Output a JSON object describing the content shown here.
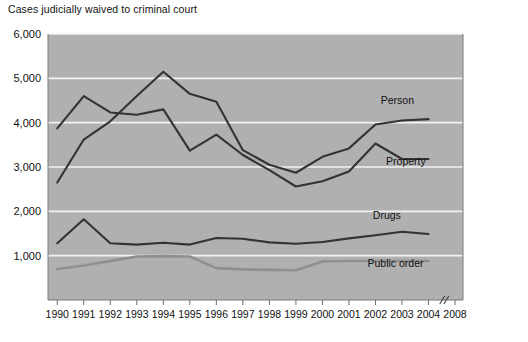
{
  "chart_data": {
    "type": "line",
    "title": "Cases judicially waived to criminal court",
    "xlabel": "",
    "ylabel": "",
    "ylim": [
      0,
      6000
    ],
    "xlim": [
      1990,
      2004
    ],
    "grid": true,
    "legend_position": "inline-right",
    "axis_break": {
      "label": "//",
      "between": [
        "2004",
        "2008"
      ]
    },
    "y_ticks": [
      "1,000",
      "2,000",
      "3,000",
      "4,000",
      "5,000",
      "6,000"
    ],
    "y_tick_values": [
      1000,
      2000,
      3000,
      4000,
      5000,
      6000
    ],
    "categories": [
      "1990",
      "1991",
      "1992",
      "1993",
      "1994",
      "1995",
      "1996",
      "1997",
      "1998",
      "1999",
      "2000",
      "2001",
      "2002",
      "2003",
      "2004"
    ],
    "x_tick_labels": [
      "1990",
      "1991",
      "1992",
      "1993",
      "1994",
      "1995",
      "1996",
      "1997",
      "1998",
      "1999",
      "2000",
      "2001",
      "2002",
      "2003",
      "2004",
      "2008"
    ],
    "series": [
      {
        "name": "Person",
        "color": "#333333",
        "width": 2.1,
        "label_x": 2002.2,
        "label_y": 4430,
        "values": [
          2650,
          3620,
          4030,
          4600,
          5150,
          4650,
          4470,
          3380,
          3050,
          2870,
          3230,
          3420,
          3960,
          4050,
          4080
        ]
      },
      {
        "name": "Property",
        "color": "#333333",
        "width": 2.1,
        "label_x": 2002.4,
        "label_y": 3050,
        "values": [
          3870,
          4600,
          4230,
          4180,
          4300,
          3370,
          3730,
          3270,
          2930,
          2560,
          2680,
          2900,
          3530,
          3180,
          3180
        ]
      },
      {
        "name": "Drugs",
        "color": "#333333",
        "width": 2.1,
        "label_x": 2001.9,
        "label_y": 1830,
        "values": [
          1280,
          1820,
          1280,
          1250,
          1290,
          1250,
          1400,
          1380,
          1300,
          1270,
          1310,
          1390,
          1460,
          1540,
          1490
        ]
      },
      {
        "name": "Public order",
        "color": "#8f8f8f",
        "width": 2.6,
        "label_x": 2001.7,
        "label_y": 740,
        "values": [
          700,
          780,
          880,
          980,
          990,
          980,
          720,
          690,
          680,
          670,
          870,
          880,
          880,
          880,
          880
        ]
      }
    ]
  }
}
